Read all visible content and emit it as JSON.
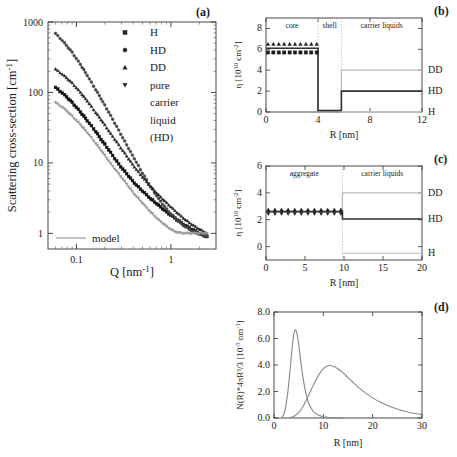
{
  "figure": {
    "panel_labels": {
      "a": "(a)",
      "b": "(b)",
      "c": "(c)",
      "d": "(d)"
    }
  },
  "panel_a": {
    "name": "scattering-curves",
    "ylabel": "Scattering cross-section [cm",
    "ylabel_exp": "-1",
    "ylabel_tail": "]",
    "xlabel": "Q [nm",
    "xlabel_exp": "-1",
    "xlabel_tail": "]",
    "y_ticks": [
      "1",
      "10",
      "100",
      "1000"
    ],
    "x_ticks": [
      "0.1",
      "1"
    ],
    "legend": [
      {
        "label": "H",
        "marker": "square"
      },
      {
        "label": "HD",
        "marker": "circle"
      },
      {
        "label": "DD",
        "marker": "triangle-up"
      },
      {
        "label": "pure",
        "marker": "triangle-down"
      },
      {
        "label": "carrier",
        "marker": "none"
      },
      {
        "label": "liquid",
        "marker": "none"
      },
      {
        "label": "(HD)",
        "marker": "none"
      }
    ],
    "model_label": "model",
    "model_color": "#aaaaaa"
  },
  "panel_b": {
    "name": "sld-profile-core-shell",
    "ylabel_pre": "η [10",
    "ylabel_exp": "10",
    "ylabel_mid": " cm",
    "ylabel_exp2": "-2",
    "ylabel_tail": "]",
    "xlabel": "R [nm]",
    "y_ticks": [
      "0",
      "2",
      "4",
      "6",
      "8"
    ],
    "x_ticks": [
      "0",
      "4",
      "8",
      "12"
    ],
    "regions": [
      "core",
      "shell",
      "carrier liquids"
    ],
    "series_labels": [
      "DD",
      "HD",
      "H"
    ],
    "levels": {
      "DD_out": 4.0,
      "HD_out": 2.0,
      "H_out": 0.0,
      "core_tri": 6.5,
      "core_sq": 5.7,
      "core_line": 6.1,
      "shell": 0.15
    },
    "boundaries": {
      "core_edge": 4.0,
      "shell_edge": 5.8,
      "xmax": 12,
      "ymax": 9
    }
  },
  "panel_c": {
    "name": "sld-profile-aggregate",
    "ylabel_pre": "η [10",
    "ylabel_exp": "10",
    "ylabel_mid": " cm",
    "ylabel_exp2": "-2",
    "ylabel_tail": "]",
    "xlabel": "R [nm]",
    "y_ticks": [
      "0",
      "2",
      "4",
      "6"
    ],
    "x_ticks": [
      "0",
      "5",
      "10",
      "15",
      "20"
    ],
    "regions": [
      "aggregate",
      "carrier liquids"
    ],
    "series_labels": [
      "DD",
      "HD",
      "H"
    ],
    "levels": {
      "DD_out": 4.0,
      "HD_out": 2.05,
      "H_out": -0.5,
      "agg_tri": 2.75,
      "agg_dtri": 2.45,
      "agg_line": 2.6
    },
    "boundaries": {
      "agg_edge": 9.8,
      "xmax": 20,
      "ymin": -1,
      "ymax": 6
    }
  },
  "panel_d": {
    "name": "size-distribution",
    "ylabel": "N(R)*4πR³/3  [10",
    "ylabel_exp": "-5",
    "ylabel_tail": " nm",
    "ylabel_exp2": "-1",
    "ylabel_end": "]",
    "xlabel": "R [nm]",
    "y_ticks": [
      "0.0",
      "2.0",
      "4.0",
      "6.0",
      "8.0"
    ],
    "x_ticks": [
      "0",
      "10",
      "20",
      "30"
    ],
    "curve_color": "#888888"
  },
  "chart_data": [
    {
      "type": "scatter",
      "panel": "(a)",
      "title": "",
      "xlabel": "Q [nm^-1]",
      "ylabel": "Scattering cross-section [cm^-1]",
      "xscale": "log",
      "yscale": "log",
      "xlim": [
        0.05,
        3.0
      ],
      "ylim": [
        0.6,
        1000
      ],
      "grid": false,
      "legend_position": "top-right",
      "legend": [
        "H",
        "HD",
        "DD",
        "pure carrier liquid (HD)",
        "model"
      ],
      "series": [
        {
          "name": "H",
          "marker": "square",
          "color": "#111111",
          "x": [
            0.06,
            0.075,
            0.09,
            0.11,
            0.13,
            0.16,
            0.19,
            0.23,
            0.28,
            0.34,
            0.41,
            0.5,
            0.61,
            0.74,
            0.9,
            1.1,
            1.35,
            1.65,
            2.0,
            2.4
          ],
          "y": [
            118,
            92,
            72,
            53,
            40,
            28,
            20,
            14,
            9.6,
            7.0,
            5.2,
            4.0,
            3.1,
            2.5,
            2.0,
            1.65,
            1.35,
            1.15,
            1.0,
            0.9
          ]
        },
        {
          "name": "HD",
          "marker": "circle",
          "color": "#444444",
          "x": [
            0.06,
            0.075,
            0.09,
            0.11,
            0.13,
            0.16,
            0.19,
            0.23,
            0.28,
            0.34,
            0.41,
            0.5,
            0.61,
            0.74,
            0.9,
            1.1,
            1.35,
            1.65,
            2.0,
            2.4
          ],
          "y": [
            690,
            500,
            370,
            250,
            175,
            110,
            74,
            47,
            29,
            18,
            11.5,
            7.2,
            4.6,
            3.1,
            2.2,
            1.65,
            1.3,
            1.1,
            0.98,
            0.9
          ]
        },
        {
          "name": "DD",
          "marker": "triangle-up",
          "color": "#222222",
          "x": [
            0.06,
            0.075,
            0.09,
            0.11,
            0.13,
            0.16,
            0.19,
            0.23,
            0.28,
            0.34,
            0.41,
            0.5,
            0.61,
            0.74,
            0.9,
            1.1,
            1.35,
            1.65,
            2.0,
            2.4
          ],
          "y": [
            215,
            170,
            136,
            100,
            76,
            52,
            38,
            26,
            18,
            12.5,
            8.8,
            6.3,
            4.6,
            3.5,
            2.7,
            2.1,
            1.65,
            1.35,
            1.15,
            1.0
          ]
        },
        {
          "name": "pure carrier liquid (HD)",
          "marker": "triangle-down",
          "color": "#999999",
          "x": [
            0.06,
            0.075,
            0.09,
            0.11,
            0.13,
            0.16,
            0.19,
            0.23,
            0.28,
            0.34,
            0.41,
            0.5,
            0.61,
            0.74,
            0.9,
            1.1,
            1.35,
            1.65,
            2.0,
            2.4
          ],
          "y": [
            72,
            58,
            46,
            35,
            27,
            19,
            14,
            9.8,
            7.0,
            5.0,
            3.6,
            2.7,
            2.0,
            1.55,
            1.25,
            1.05,
            1.0,
            1.0,
            1.0,
            1.0
          ]
        }
      ],
      "model_curves": 4,
      "notes": "Four model (solid grey) lines follow each data series; flat baseline near 1 cm^-1 at high Q from incoherent background."
    },
    {
      "type": "line",
      "panel": "(b)",
      "title": "",
      "xlabel": "R [nm]",
      "ylabel": "eta [10^10 cm^-2]",
      "xlim": [
        0,
        12
      ],
      "ylim": [
        0,
        9
      ],
      "xticks": [
        0,
        4,
        8,
        12
      ],
      "yticks": [
        0,
        2,
        4,
        6,
        8
      ],
      "grid": false,
      "annotations": [
        "core",
        "shell",
        "carrier liquids"
      ],
      "region_boundaries": [
        4.0,
        5.8
      ],
      "series": [
        {
          "name": "DD",
          "color": "#bbbbbb",
          "x": [
            0,
            4,
            4,
            5.8,
            5.8,
            12
          ],
          "y": [
            6.1,
            6.1,
            0.15,
            0.15,
            4.0,
            4.0
          ]
        },
        {
          "name": "HD",
          "color": "#333333",
          "x": [
            0,
            4,
            4,
            5.8,
            5.8,
            12
          ],
          "y": [
            6.1,
            6.1,
            0.15,
            0.15,
            2.0,
            2.0
          ]
        },
        {
          "name": "H",
          "color": "#cccccc",
          "x": [
            5.8,
            12
          ],
          "y": [
            0.0,
            0.0
          ]
        },
        {
          "name": "core-triangles",
          "marker": "triangle-up",
          "y": 6.5,
          "x_range": [
            0.15,
            3.9
          ]
        },
        {
          "name": "core-squares",
          "marker": "square",
          "y": 5.7,
          "x_range": [
            0.15,
            3.9
          ]
        }
      ]
    },
    {
      "type": "line",
      "panel": "(c)",
      "title": "",
      "xlabel": "R [nm]",
      "ylabel": "eta [10^10 cm^-2]",
      "xlim": [
        0,
        20
      ],
      "ylim": [
        -1,
        6
      ],
      "xticks": [
        0,
        5,
        10,
        15,
        20
      ],
      "yticks": [
        0,
        2,
        4,
        6
      ],
      "grid": false,
      "annotations": [
        "aggregate",
        "carrier liquids"
      ],
      "region_boundaries": [
        9.8
      ],
      "series": [
        {
          "name": "DD",
          "color": "#bbbbbb",
          "x": [
            0,
            9.8,
            9.8,
            20
          ],
          "y": [
            2.6,
            2.6,
            4.0,
            4.0
          ]
        },
        {
          "name": "HD",
          "color": "#333333",
          "x": [
            0,
            9.8,
            9.8,
            20
          ],
          "y": [
            2.6,
            2.6,
            2.05,
            2.05
          ]
        },
        {
          "name": "H",
          "color": "#cccccc",
          "x": [
            9.8,
            20
          ],
          "y": [
            -0.5,
            -0.5
          ]
        },
        {
          "name": "agg-triangles-up",
          "marker": "triangle-up",
          "y": 2.75,
          "x_range": [
            0.3,
            9.6
          ]
        },
        {
          "name": "agg-triangles-down",
          "marker": "triangle-down",
          "y": 2.45,
          "x_range": [
            0.3,
            9.6
          ]
        }
      ]
    },
    {
      "type": "line",
      "panel": "(d)",
      "title": "",
      "xlabel": "R [nm]",
      "ylabel": "N(R)*4piR^3/3 [10^-5 nm^-1]",
      "xlim": [
        0,
        30
      ],
      "ylim": [
        0,
        8
      ],
      "xticks": [
        0,
        10,
        20,
        30
      ],
      "yticks": [
        0.0,
        2.0,
        4.0,
        6.0,
        8.0
      ],
      "grid": false,
      "series": [
        {
          "name": "primary-particles",
          "color": "#888888",
          "peak_x": 4.3,
          "peak_y": 6.65,
          "x": [
            1.6,
            2.0,
            2.4,
            2.8,
            3.2,
            3.6,
            4.0,
            4.3,
            4.6,
            5.0,
            5.4,
            5.8,
            6.2,
            6.6,
            7.0,
            7.6,
            8.2,
            8.8,
            9.4,
            10.0,
            10.8,
            11.6,
            12.4,
            13.2,
            14.0
          ],
          "y": [
            0.05,
            0.3,
            0.9,
            1.95,
            3.4,
            5.0,
            6.3,
            6.65,
            6.45,
            5.55,
            4.35,
            3.25,
            2.35,
            1.65,
            1.15,
            0.7,
            0.42,
            0.26,
            0.16,
            0.1,
            0.06,
            0.03,
            0.02,
            0.01,
            0.0
          ]
        },
        {
          "name": "aggregates",
          "color": "#888888",
          "peak_x": 11.0,
          "peak_y": 3.95,
          "x": [
            3.0,
            4.0,
            5.0,
            6.0,
            7.0,
            8.0,
            9.0,
            10.0,
            11.0,
            12.0,
            13.0,
            14.0,
            15.0,
            16.0,
            17.0,
            18.0,
            19.0,
            20.0,
            21.5,
            23.0,
            24.5,
            26.0,
            27.5,
            29.0,
            30.0
          ],
          "y": [
            0.02,
            0.12,
            0.4,
            0.95,
            1.7,
            2.5,
            3.2,
            3.72,
            3.95,
            3.9,
            3.7,
            3.4,
            3.05,
            2.7,
            2.35,
            2.05,
            1.78,
            1.52,
            1.2,
            0.94,
            0.74,
            0.56,
            0.42,
            0.32,
            0.26
          ]
        }
      ]
    }
  ]
}
